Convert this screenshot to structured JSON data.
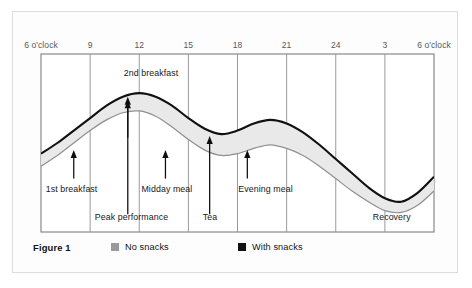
{
  "figure": {
    "caption": "Figure 1"
  },
  "legend": {
    "entries": [
      {
        "label": "No snacks",
        "color": "#9a9a9a",
        "icon": "square-swatch"
      },
      {
        "label": "With snacks",
        "color": "#111111",
        "icon": "square-swatch"
      }
    ]
  },
  "chart_data": {
    "type": "area",
    "title": "Figure 1",
    "xlabel": "",
    "ylabel": "",
    "grid": true,
    "legend_position": "bottom",
    "xlim": [
      6,
      30
    ],
    "ylim": [
      0,
      100
    ],
    "x_tick_values": [
      6,
      9,
      12,
      15,
      18,
      21,
      24,
      27,
      30
    ],
    "x_tick_labels": [
      "6 o'clock",
      "9",
      "12",
      "15",
      "18",
      "21",
      "24",
      "3",
      "6 o'clock"
    ],
    "x_unit": "hour of day",
    "series": [
      {
        "name": "With snacks",
        "color": "#111111",
        "role": "upper-bound",
        "x": [
          6,
          7,
          8,
          9,
          10,
          11,
          12,
          13,
          14,
          15,
          16,
          17,
          18,
          19,
          20,
          21,
          22,
          23,
          24,
          25,
          26,
          27,
          28,
          29,
          30
        ],
        "values": [
          44,
          50,
          57,
          64,
          71,
          76,
          78,
          76,
          71,
          64,
          58,
          55,
          57,
          61,
          63,
          61,
          56,
          49,
          41,
          33,
          25,
          19,
          17,
          22,
          31
        ]
      },
      {
        "name": "No snacks",
        "color": "#8f8f8f",
        "role": "lower-bound",
        "x": [
          6,
          7,
          8,
          9,
          10,
          11,
          12,
          13,
          14,
          15,
          16,
          17,
          18,
          19,
          20,
          21,
          22,
          23,
          24,
          25,
          26,
          27,
          28,
          29,
          30
        ],
        "values": [
          37,
          43,
          50,
          57,
          63,
          67,
          68,
          65,
          59,
          52,
          46,
          43,
          44,
          47,
          49,
          47,
          43,
          37,
          30,
          23,
          17,
          12,
          11,
          15,
          23
        ]
      }
    ],
    "band_fill": "#e9e9e9",
    "annotations": [
      {
        "label": "1st breakfast",
        "x": 8.0,
        "arrow_from_y": 30,
        "arrow_to_y": 46,
        "label_position": "below"
      },
      {
        "label": "2nd breakfast",
        "x": 11.3,
        "arrow_from_y": 53,
        "arrow_to_y": 76,
        "label_position": "above"
      },
      {
        "label": "Peak performance",
        "x": 11.3,
        "arrow_from_y": 10,
        "arrow_to_y": 74,
        "label_position": "below"
      },
      {
        "label": "Midday meal",
        "x": 13.6,
        "arrow_from_y": 30,
        "arrow_to_y": 46,
        "label_position": "below"
      },
      {
        "label": "Tea",
        "x": 16.3,
        "arrow_from_y": 10,
        "arrow_to_y": 54,
        "label_position": "below"
      },
      {
        "label": "Evening meal",
        "x": 18.6,
        "arrow_from_y": 30,
        "arrow_to_y": 46,
        "label_position": "below"
      },
      {
        "label": "Recovery",
        "x": 27.6,
        "arrow_from_y": null,
        "arrow_to_y": null,
        "label_position": "below"
      }
    ]
  }
}
